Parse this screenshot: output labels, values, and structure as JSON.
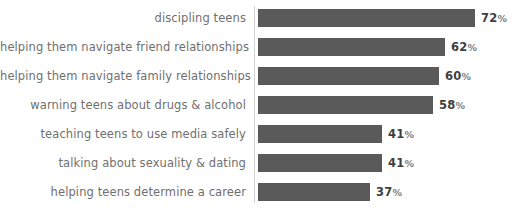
{
  "chart_data": {
    "type": "bar",
    "orientation": "horizontal",
    "title": "",
    "subtitle": "",
    "xlabel": "",
    "ylabel": "",
    "grid": false,
    "legend": null,
    "axis": {
      "category_axis": "vertical-line-left-of-bars",
      "value_axis_visible": false,
      "xlim": [
        0,
        100
      ],
      "value_unit": "%"
    },
    "categories": [
      "discipling teens",
      "helping them navigate friend relationships",
      "helping them navigate family relationships",
      "warning teens about drugs & alcohol",
      "teaching teens to use media safely",
      "talking about sexuality & dating",
      "helping teens determine a career"
    ],
    "values": [
      72,
      62,
      60,
      58,
      41,
      41,
      37
    ],
    "value_labels": [
      "72%",
      "62%",
      "60%",
      "58%",
      "41%",
      "41%",
      "37%"
    ],
    "bars": [
      {
        "label": "discipling teens",
        "value": 72,
        "value_label": "72%",
        "percent_suffix": "%"
      },
      {
        "label": "helping them navigate friend relationships",
        "value": 62,
        "value_label": "62%",
        "percent_suffix": "%"
      },
      {
        "label": "helping them navigate family relationships",
        "value": 60,
        "value_label": "60%",
        "percent_suffix": "%"
      },
      {
        "label": "warning teens about drugs & alcohol",
        "value": 58,
        "value_label": "58%",
        "percent_suffix": "%"
      },
      {
        "label": "teaching teens to use media safely",
        "value": 41,
        "value_label": "41%",
        "percent_suffix": "%"
      },
      {
        "label": "talking about sexuality & dating",
        "value": 41,
        "value_label": "41%",
        "percent_suffix": "%"
      },
      {
        "label": "helping teens determine a career",
        "value": 37,
        "value_label": "37%",
        "percent_suffix": "%"
      }
    ],
    "colors": {
      "bar": "#5a5a5a",
      "category_label": "#6f6f6f",
      "value_number": "#3f3f3f",
      "value_percent_sign": "#7d7d7d",
      "axis_line": "#d2d2d2",
      "background": "#ffffff"
    }
  },
  "layout": {
    "bar_origin_x": 258,
    "px_per_percent": 3.02,
    "bar_height": 18,
    "row_pitch": 29,
    "first_row_top": 9
  }
}
